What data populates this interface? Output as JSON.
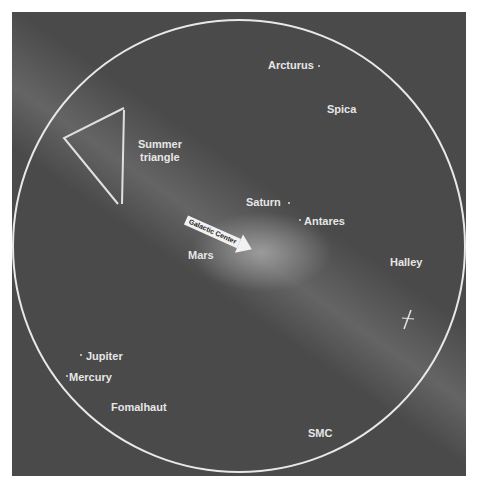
{
  "chart": {
    "frame": {
      "background": "#4a4a4a",
      "circle_color": "#e8e8e8"
    },
    "labels": {
      "arcturus": "Arcturus",
      "spica": "Spica",
      "summer_triangle_1": "Summer",
      "summer_triangle_2": "triangle",
      "saturn": "Saturn",
      "antares": "Antares",
      "galactic_center": "Galactic Center",
      "mars": "Mars",
      "halley": "Halley",
      "jupiter": "Jupiter",
      "mercury": "Mercury",
      "fomalhaut": "Fomalhaut",
      "smc": "SMC"
    }
  }
}
